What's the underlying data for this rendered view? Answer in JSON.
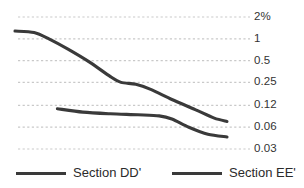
{
  "chart_data": {
    "type": "line",
    "title": "",
    "xlabel": "",
    "ylabel": "",
    "scale": "log",
    "grid": true,
    "legend_position": "bottom",
    "y_tick_labels": [
      "2%",
      "1",
      "0.5",
      "0.25",
      "0.12",
      "0.06",
      "0.03"
    ],
    "y_tick_values": [
      2,
      1,
      0.5,
      0.25,
      0.12,
      0.06,
      0.03
    ],
    "ylim": [
      0.03,
      2
    ],
    "series": [
      {
        "name": "Section DD'",
        "color": "#3a3a3a",
        "points": [
          {
            "x": 0.0,
            "y": 1.28
          },
          {
            "x": 0.09,
            "y": 1.22
          },
          {
            "x": 0.16,
            "y": 1.0
          },
          {
            "x": 0.25,
            "y": 0.72
          },
          {
            "x": 0.35,
            "y": 0.48
          },
          {
            "x": 0.45,
            "y": 0.3
          },
          {
            "x": 0.5,
            "y": 0.25
          },
          {
            "x": 0.57,
            "y": 0.235
          },
          {
            "x": 0.64,
            "y": 0.2
          },
          {
            "x": 0.74,
            "y": 0.145
          },
          {
            "x": 0.85,
            "y": 0.105
          },
          {
            "x": 0.94,
            "y": 0.08
          },
          {
            "x": 1.0,
            "y": 0.072
          }
        ]
      },
      {
        "name": "Section EE'",
        "color": "#3a3a3a",
        "points": [
          {
            "x": 0.2,
            "y": 0.108
          },
          {
            "x": 0.32,
            "y": 0.097
          },
          {
            "x": 0.45,
            "y": 0.092
          },
          {
            "x": 0.58,
            "y": 0.089
          },
          {
            "x": 0.68,
            "y": 0.086
          },
          {
            "x": 0.74,
            "y": 0.078
          },
          {
            "x": 0.82,
            "y": 0.06
          },
          {
            "x": 0.91,
            "y": 0.048
          },
          {
            "x": 1.0,
            "y": 0.044
          }
        ]
      }
    ]
  },
  "axis": {
    "ticks": [
      {
        "label": "2%"
      },
      {
        "label": "1"
      },
      {
        "label": "0.5"
      },
      {
        "label": "0.25"
      },
      {
        "label": "0.12"
      },
      {
        "label": "0.06"
      },
      {
        "label": "0.03"
      }
    ]
  },
  "legend": {
    "items": [
      {
        "label": "Section DD'"
      },
      {
        "label": "Section EE'"
      }
    ]
  },
  "colors": {
    "line": "#3a3a3a",
    "grid": "#c9c9c9",
    "text": "#333333",
    "background": "#ffffff"
  }
}
